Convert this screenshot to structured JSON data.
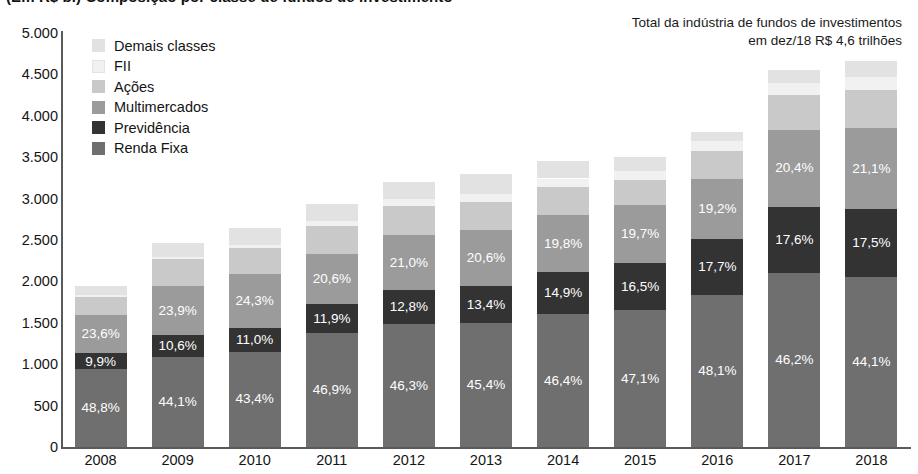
{
  "title": "(Em R$ bi) Composição por classe de fundos de investimento",
  "annotation": {
    "line1": "Total da indústria de fundos de investimentos",
    "line2": "em dez/18 R$ 4,6 trilhões"
  },
  "legend": {
    "items": [
      {
        "label": "Demais classes",
        "color": "#e2e2e2"
      },
      {
        "label": "FII",
        "color": "#f1f1f1"
      },
      {
        "label": "Ações",
        "color": "#c9c9c9"
      },
      {
        "label": "Multimercados",
        "color": "#9b9b9b"
      },
      {
        "label": "Previdência",
        "color": "#333333"
      },
      {
        "label": "Renda Fixa",
        "color": "#6f6f6f"
      }
    ]
  },
  "chart_data": {
    "type": "bar",
    "stacked": true,
    "title": "(Em R$ bi) Composição por classe de fundos de investimento",
    "xlabel": "",
    "ylabel": "",
    "ylim": [
      0,
      5000
    ],
    "ytick_labels": [
      "0",
      "500",
      "1.000",
      "1.500",
      "2.000",
      "2.500",
      "3.000",
      "3.500",
      "4.000",
      "4.500",
      "5.000"
    ],
    "ytick_values": [
      0,
      500,
      1000,
      1500,
      2000,
      2500,
      3000,
      3500,
      4000,
      4500,
      5000
    ],
    "grid": false,
    "legend_position": "top-left",
    "categories": [
      "2008",
      "2009",
      "2010",
      "2011",
      "2012",
      "2013",
      "2014",
      "2015",
      "2016",
      "2017",
      "2018"
    ],
    "totals": [
      1940,
      2470,
      2650,
      2930,
      3200,
      3300,
      3450,
      3500,
      3810,
      4550,
      4660
    ],
    "series": [
      {
        "name": "Renda Fixa",
        "color": "#6f6f6f",
        "values": [
          946,
          1089,
          1150,
          1374,
          1482,
          1498,
          1601,
          1649,
          1833,
          2102,
          2055
        ],
        "labels": [
          "48,8%",
          "44,1%",
          "43,4%",
          "46,9%",
          "46,3%",
          "45,4%",
          "46,4%",
          "47,1%",
          "48,1%",
          "46,2%",
          "44,1%"
        ]
      },
      {
        "name": "Previdência",
        "color": "#333333",
        "values": [
          192,
          262,
          292,
          349,
          410,
          442,
          514,
          578,
          674,
          801,
          816
        ],
        "labels": [
          "9,9%",
          "10,6%",
          "11,0%",
          "11,9%",
          "12,8%",
          "13,4%",
          "14,9%",
          "16,5%",
          "17,7%",
          "17,6%",
          "17,5%"
        ]
      },
      {
        "name": "Multimercados",
        "color": "#9b9b9b",
        "values": [
          458,
          590,
          644,
          604,
          672,
          680,
          683,
          690,
          732,
          928,
          983
        ],
        "labels": [
          "23,6%",
          "23,9%",
          "24,3%",
          "20,6%",
          "21,0%",
          "20,6%",
          "19,8%",
          "19,7%",
          "19,2%",
          "20,4%",
          "21,1%"
        ]
      },
      {
        "name": "Ações",
        "color": "#c9c9c9",
        "values": [
          216,
          324,
          316,
          345,
          346,
          340,
          339,
          305,
          333,
          420,
          462
        ],
        "labels": [
          "",
          "",
          "",
          "",
          "",
          "",
          "",
          "",
          "",
          "",
          ""
        ]
      },
      {
        "name": "FII",
        "color": "#f1f1f1",
        "values": [
          18,
          35,
          42,
          58,
          80,
          95,
          106,
          112,
          128,
          143,
          154
        ],
        "labels": [
          "",
          "",
          "",
          "",
          "",
          "",
          "",
          "",
          "",
          "",
          ""
        ]
      },
      {
        "name": "Demais classes",
        "color": "#e2e2e2",
        "values": [
          110,
          170,
          206,
          200,
          210,
          245,
          207,
          166,
          110,
          156,
          190
        ],
        "labels": [
          "",
          "",
          "",
          "",
          "",
          "",
          "",
          "",
          "",
          "",
          ""
        ]
      }
    ]
  }
}
